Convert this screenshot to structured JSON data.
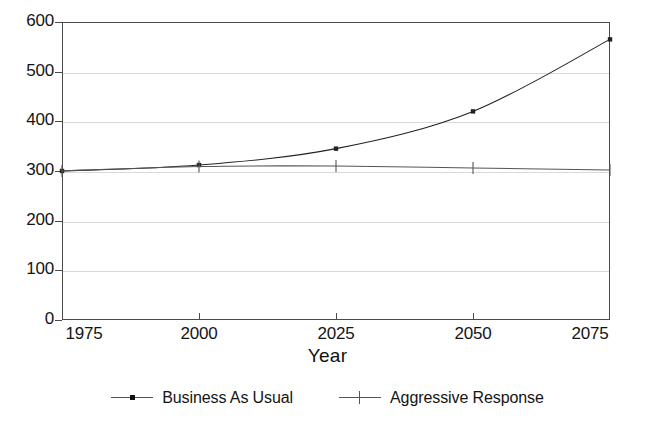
{
  "chart_data": {
    "type": "line",
    "title": "",
    "subtitle": "",
    "xlabel": "Year",
    "ylabel": "",
    "x": [
      1975,
      2000,
      2025,
      2050,
      2075
    ],
    "xlim": [
      1975,
      2075
    ],
    "ylim": [
      0,
      600
    ],
    "xticks": [
      "1975",
      "2000",
      "2025",
      "2050",
      "2075"
    ],
    "yticks": [
      "0",
      "100",
      "200",
      "300",
      "400",
      "500",
      "600"
    ],
    "grid": "horizontal",
    "legend_position": "bottom",
    "series": [
      {
        "name": "Business As Usual",
        "marker": "square",
        "color": "#222222",
        "values": [
          300,
          312,
          345,
          420,
          565
        ]
      },
      {
        "name": "Aggressive Response",
        "marker": "plus",
        "color": "#555555",
        "values": [
          300,
          309,
          310,
          306,
          302
        ]
      }
    ]
  },
  "axis": {
    "x_label": "Year"
  },
  "legend": {
    "items": [
      {
        "label": "Business As Usual",
        "marker": "square-marker-icon"
      },
      {
        "label": "Aggressive Response",
        "marker": "plus-marker-icon"
      }
    ]
  }
}
